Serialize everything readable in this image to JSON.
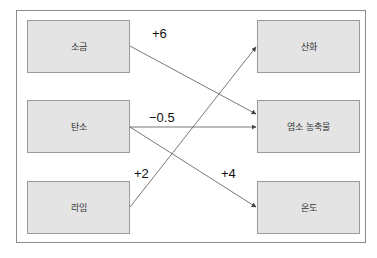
{
  "diagram": {
    "sources": [
      {
        "id": "salt",
        "label": "소금"
      },
      {
        "id": "carbon",
        "label": "탄소"
      },
      {
        "id": "lime",
        "label": "라임"
      }
    ],
    "targets": [
      {
        "id": "oxidation",
        "label": "산화"
      },
      {
        "id": "chlorine_concentrate",
        "label": "염소 농축물"
      },
      {
        "id": "temperature",
        "label": "온도"
      }
    ],
    "edges": [
      {
        "from": "소금",
        "to": "염소 농축물",
        "weight": "+6"
      },
      {
        "from": "탄소",
        "to": "염소 농축물",
        "weight": "−0.5"
      },
      {
        "from": "탄소",
        "to": "온도",
        "weight": "+4"
      },
      {
        "from": "라임",
        "to": "산화",
        "weight": "+2"
      }
    ],
    "colors": {
      "box_fill": "#e4e4e4",
      "box_border": "#9a9a9a",
      "line": "#555555",
      "frame": "#8a8a8a"
    }
  }
}
